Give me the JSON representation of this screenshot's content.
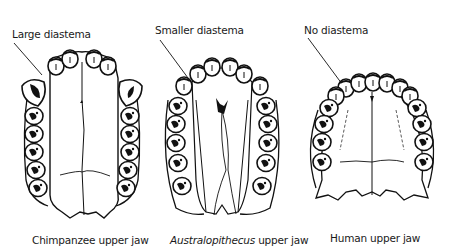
{
  "figure": {
    "type": "comparative-anatomy-diagram",
    "panels": [
      {
        "id": "chimpanzee",
        "annotation": "Large diastema",
        "caption_italic": "",
        "caption_rest": "Chimpanzee upper jaw",
        "arch_shape": "U-shaped, parallel tooth rows"
      },
      {
        "id": "australopithecus",
        "annotation": "Smaller diastema",
        "caption_italic": "Australopithecus",
        "caption_rest": " upper jaw",
        "arch_shape": "V-shaped, slightly diverging tooth rows"
      },
      {
        "id": "human",
        "annotation": "No diastema",
        "caption_italic": "",
        "caption_rest": "Human upper jaw",
        "arch_shape": "parabolic arch"
      }
    ]
  }
}
